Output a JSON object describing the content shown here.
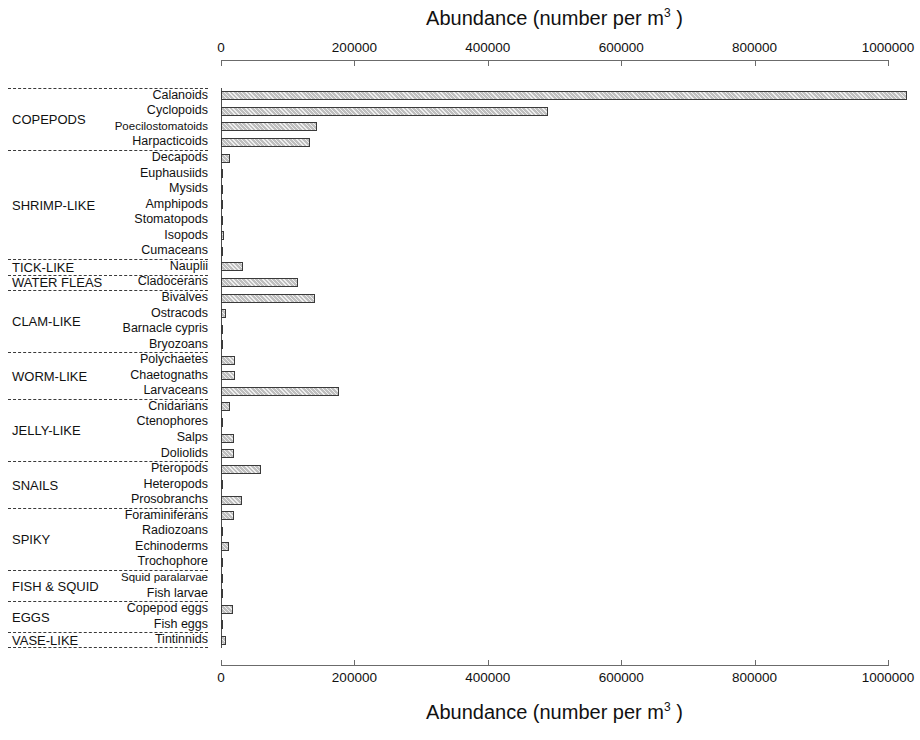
{
  "chart_data": {
    "type": "bar",
    "orientation": "horizontal",
    "title": "",
    "xlabel": "Abundance (number per m3 )",
    "xlabel_html": "Abundance (number per m<sup>3</sup> )",
    "ylabel": "",
    "xlim": [
      0,
      1000000
    ],
    "grid": false,
    "legend": null,
    "xticks": [
      0,
      200000,
      400000,
      600000,
      800000,
      1000000
    ],
    "xtick_labels": [
      "0",
      "200000",
      "400000",
      "600000",
      "800000",
      "1000000"
    ],
    "axis_title_top": "Abundance (number per m",
    "axis_title_sup": "3",
    "axis_title_tail": " )",
    "categories": [
      "Calanoids",
      "Cyclopoids",
      "Poecilostomatoids",
      "Harpacticoids",
      "Decapods",
      "Euphausiids",
      "Mysids",
      "Amphipods",
      "Stomatopods",
      "Isopods",
      "Cumaceans",
      "Nauplii",
      "Cladocerans",
      "Bivalves",
      "Ostracods",
      "Barnacle cypris",
      "Bryozoans",
      "Polychaetes",
      "Chaetognaths",
      "Larvaceans",
      "Cnidarians",
      "Ctenophores",
      "Salps",
      "Doliolids",
      "Pteropods",
      "Heteropods",
      "Prosobranchs",
      "Foraminiferans",
      "Radiozoans",
      "Echinoderms",
      "Trochophore",
      "Squid paralarvae",
      "Fish  larvae",
      "Copepod eggs",
      "Fish eggs",
      "Tintinnids"
    ],
    "values": [
      1029000,
      491000,
      144000,
      134000,
      12800,
      3000,
      400,
      1500,
      300,
      4000,
      600,
      33500,
      115600,
      141400,
      7200,
      3000,
      3600,
      20500,
      21600,
      177300,
      13400,
      800,
      19000,
      20000,
      60000,
      700,
      30800,
      20000,
      1200,
      11300,
      500,
      900,
      2000,
      17500,
      1300,
      7200
    ],
    "groups": [
      {
        "name": "COPEPODS",
        "count": 4
      },
      {
        "name": "SHRIMP-LIKE",
        "count": 7
      },
      {
        "name": "TICK-LIKE",
        "count": 1
      },
      {
        "name": "WATER FLEAS",
        "count": 1
      },
      {
        "name": "CLAM-LIKE",
        "count": 4
      },
      {
        "name": "WORM-LIKE",
        "count": 3
      },
      {
        "name": "JELLY-LIKE",
        "count": 4
      },
      {
        "name": "SNAILS",
        "count": 3
      },
      {
        "name": "SPIKY",
        "count": 4
      },
      {
        "name": "FISH & SQUID",
        "count": 2
      },
      {
        "name": "EGGS",
        "count": 2
      },
      {
        "name": "VASE-LIKE",
        "count": 1
      }
    ],
    "colors": {
      "bar_fill": "#bfbfbf",
      "bar_edge": "#3a3a3a",
      "axis": "#6b6b6b",
      "text": "#111111",
      "divider": "#3a3a3a",
      "background": "#ffffff"
    }
  }
}
